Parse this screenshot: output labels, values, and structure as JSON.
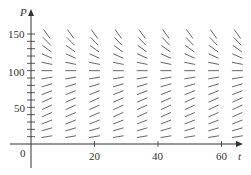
{
  "diagram": {
    "type": "slope_field",
    "x_axis": {
      "label": "t",
      "ticks": [
        "20",
        "40",
        "60"
      ],
      "origin_label": "0"
    },
    "y_axis": {
      "label": "P",
      "ticks": [
        "50",
        "100",
        "150"
      ]
    },
    "equilibrium": 100,
    "colors": {
      "axis": "#333333",
      "segment": "#555555"
    }
  }
}
